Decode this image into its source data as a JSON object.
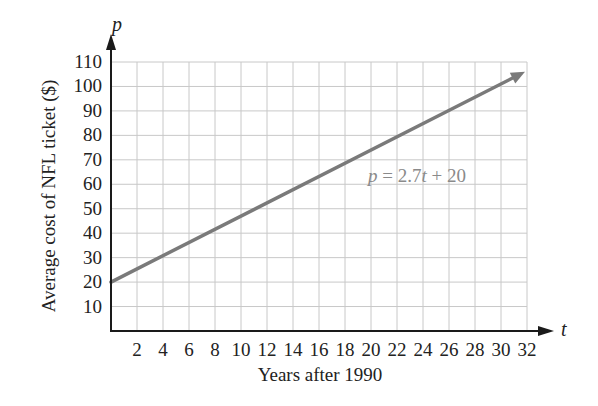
{
  "chart_data": {
    "type": "line",
    "title": "",
    "xlabel": "Years after 1990",
    "ylabel": "Average cost of NFL ticket ($)",
    "x_axis_var": "t",
    "y_axis_var": "p",
    "xlim": [
      0,
      32
    ],
    "ylim": [
      0,
      110
    ],
    "x_ticks": [
      2,
      4,
      6,
      8,
      10,
      12,
      14,
      16,
      18,
      20,
      22,
      24,
      26,
      28,
      30,
      32
    ],
    "y_ticks": [
      10,
      20,
      30,
      40,
      50,
      60,
      70,
      80,
      90,
      100,
      110
    ],
    "grid": true,
    "series": [
      {
        "name": "p = 2.7t + 20",
        "equation": "p = 2.7t + 20",
        "slope": 2.7,
        "intercept": 20,
        "x": [
          0,
          4,
          8,
          12,
          16,
          20,
          24,
          28,
          32
        ],
        "values": [
          20,
          30.8,
          41.6,
          52.4,
          63.2,
          74,
          84.8,
          95.6,
          106.4
        ],
        "color": "#7a7a7a"
      }
    ],
    "annotations": [
      {
        "text": "p = 2.7t + 20",
        "x": 20,
        "y": 66
      }
    ],
    "legend": "none"
  },
  "labels": {
    "y_var": "p",
    "x_var": "t",
    "x_title": "Years after 1990",
    "y_title": "Average cost of NFL ticket ($)",
    "equation": {
      "p": "p",
      "eq": " = 2.7",
      "t": "t",
      "rest": " + 20"
    }
  },
  "colors": {
    "axis": "#1a1a1a",
    "grid": "#c8c8c8",
    "line": "#7a7a7a",
    "text": "#222222",
    "annotation": "#8a8a8a"
  }
}
